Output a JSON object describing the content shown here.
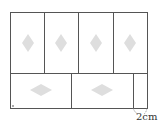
{
  "diagram": {
    "colors": {
      "stroke": "#555555",
      "diamond": "#dcdcdc",
      "background": "#ffffff"
    },
    "gap_label": "2cm",
    "top_tiles": 4,
    "bottom_tiles": 2
  }
}
